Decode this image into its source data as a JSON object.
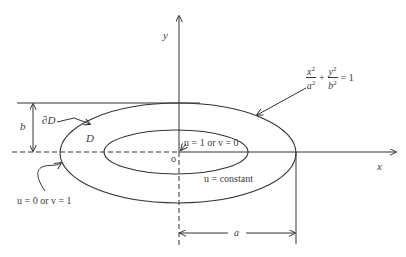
{
  "diagram": {
    "axes": {
      "x_label": "x",
      "y_label": "y",
      "origin_label": "o"
    },
    "labels": {
      "boundary": "∂D",
      "domain": "D",
      "semi_minor": "b",
      "semi_major": "a",
      "inner_condition": "u = 1 or v = 0",
      "outer_condition": "u = 0 or v = 1",
      "level_curve": "u = constant"
    },
    "equation": {
      "term1_num": "x",
      "term1_den": "a",
      "term2_num": "y",
      "term2_den": "b",
      "exponent": "2",
      "plus": "+",
      "rhs": "= 1"
    },
    "geometry": {
      "origin": [
        179,
        152
      ],
      "outer_ellipse": {
        "cx": 178,
        "cy": 152,
        "rx": 118,
        "ry": 50
      },
      "inner_ellipse": {
        "cx": 176,
        "cy": 152,
        "rx": 72,
        "ry": 22
      }
    },
    "colors": {
      "stroke": "#333333",
      "text": "#3a3a3a"
    }
  }
}
